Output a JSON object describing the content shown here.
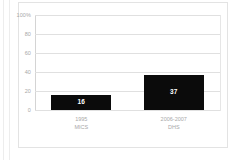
{
  "chart_data": {
    "type": "bar",
    "title": "",
    "subtitle": "",
    "xlabel": "",
    "ylabel": "",
    "categories": [
      "1995\nMICS",
      "2006-2007\nDHS"
    ],
    "category_lines": [
      {
        "line1": "1995",
        "line2": "MICS"
      },
      {
        "line1": "2006-2007",
        "line2": "DHS"
      }
    ],
    "values": [
      16,
      37
    ],
    "value_labels": [
      "16",
      "37"
    ],
    "ylim": [
      0,
      100
    ],
    "yticks": [
      0,
      20,
      40,
      60,
      80,
      100
    ],
    "ytick_labels": [
      "0",
      "20",
      "40",
      "60",
      "80",
      "100%"
    ],
    "grid": true,
    "legend": false,
    "legend_position": "none",
    "bar_color": "#0b0b0b",
    "grid_color": "#e0e0e0",
    "axis_text_color": "#a8a8a8",
    "value_label_color": "#ffffff",
    "background_color": "#ffffff",
    "border_color": "#e3e3e3"
  }
}
